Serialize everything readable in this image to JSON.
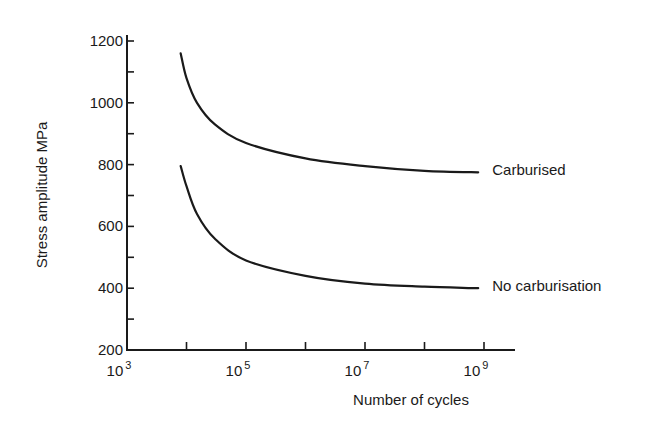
{
  "chart_data": {
    "type": "line",
    "title": "",
    "xlabel": "Number of cycles",
    "ylabel": "Stress amplitude MPa",
    "xscale": "log",
    "xlim": [
      1000,
      1000000000
    ],
    "ylim": [
      200,
      1200
    ],
    "x_ticks": [
      {
        "exp": 3,
        "label_base": "10",
        "label_exp": "3"
      },
      {
        "exp": 4,
        "label_base": "",
        "label_exp": ""
      },
      {
        "exp": 5,
        "label_base": "10",
        "label_exp": "5"
      },
      {
        "exp": 6,
        "label_base": "",
        "label_exp": ""
      },
      {
        "exp": 7,
        "label_base": "10",
        "label_exp": "7"
      },
      {
        "exp": 8,
        "label_base": "",
        "label_exp": ""
      },
      {
        "exp": 9,
        "label_base": "10",
        "label_exp": "9"
      }
    ],
    "y_ticks": [
      200,
      300,
      400,
      500,
      600,
      700,
      800,
      900,
      1000,
      1100,
      1200
    ],
    "y_tick_labels": [
      "200",
      "",
      "400",
      "",
      "600",
      "",
      "800",
      "",
      "1000",
      "",
      "1200"
    ],
    "grid": false,
    "legend": "inline labels at right end of curves",
    "series": [
      {
        "name": "Carburised",
        "color": "#1a1a1a",
        "points": [
          {
            "x": 8000,
            "y": 1160
          },
          {
            "x": 10000,
            "y": 1080
          },
          {
            "x": 15000,
            "y": 1000
          },
          {
            "x": 30000,
            "y": 930
          },
          {
            "x": 100000,
            "y": 870
          },
          {
            "x": 1000000,
            "y": 820
          },
          {
            "x": 10000000,
            "y": 795
          },
          {
            "x": 100000000,
            "y": 780
          },
          {
            "x": 800000000,
            "y": 775
          }
        ]
      },
      {
        "name": "No carburisation",
        "color": "#1a1a1a",
        "points": [
          {
            "x": 8000,
            "y": 795
          },
          {
            "x": 10000,
            "y": 730
          },
          {
            "x": 15000,
            "y": 640
          },
          {
            "x": 30000,
            "y": 560
          },
          {
            "x": 100000,
            "y": 490
          },
          {
            "x": 1000000,
            "y": 440
          },
          {
            "x": 10000000,
            "y": 415
          },
          {
            "x": 100000000,
            "y": 405
          },
          {
            "x": 800000000,
            "y": 400
          }
        ]
      }
    ]
  }
}
